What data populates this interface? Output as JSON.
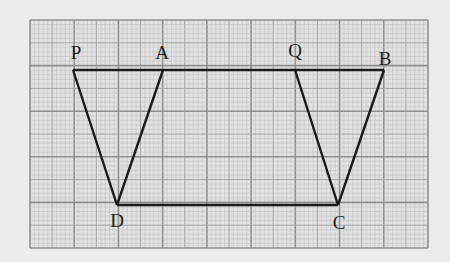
{
  "figure": {
    "type": "geometry-diagram-on-graph-paper",
    "background_color": "#ececec",
    "grid": {
      "x0": 30,
      "y0": 20,
      "x1": 428,
      "y1": 248,
      "major_cols": 9,
      "major_rows": 5,
      "minor_per_major": 10,
      "minor_color": "#bdbdbd",
      "mid_color": "#a6a6a6",
      "major_color": "#8f8f8f"
    },
    "line_color": "#1a1a1a",
    "points": [
      {
        "name": "P",
        "x": 73,
        "y": 70
      },
      {
        "name": "A",
        "x": 163,
        "y": 70
      },
      {
        "name": "Q",
        "x": 295,
        "y": 70
      },
      {
        "name": "B",
        "x": 384,
        "y": 70
      },
      {
        "name": "D",
        "x": 117,
        "y": 205
      },
      {
        "name": "C",
        "x": 338,
        "y": 205
      }
    ],
    "segments": [
      [
        "P",
        "B"
      ],
      [
        "D",
        "C"
      ],
      [
        "P",
        "D"
      ],
      [
        "A",
        "D"
      ],
      [
        "Q",
        "C"
      ],
      [
        "B",
        "C"
      ]
    ],
    "labels": [
      {
        "text": "P",
        "x": 76,
        "y": 43
      },
      {
        "text": "A",
        "x": 162,
        "y": 43
      },
      {
        "text": "Q",
        "x": 295,
        "y": 41
      },
      {
        "text": "B",
        "x": 385,
        "y": 49
      },
      {
        "text": "D",
        "x": 117,
        "y": 211
      },
      {
        "text": "C",
        "x": 339,
        "y": 213
      }
    ]
  }
}
